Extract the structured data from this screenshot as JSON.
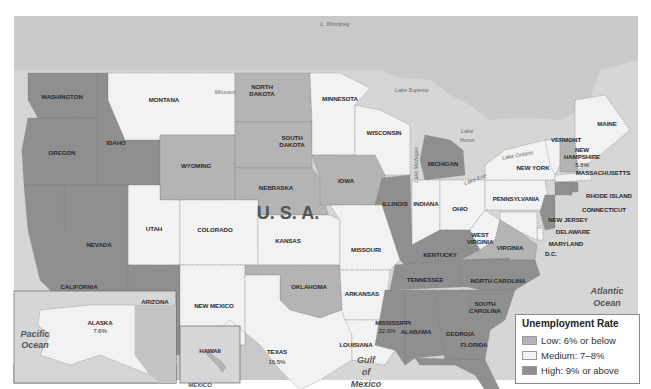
{
  "map": {
    "country_label": "U.   S.   A.",
    "colors": {
      "low": "#b4b4b4",
      "medium": "#f2f2f2",
      "high": "#8f8f8f",
      "water": "#d9d9d9",
      "foreign_land": "#cdcdcd"
    },
    "water_labels": {
      "pacific_1": "Pacific",
      "pacific_2": "Ocean",
      "atlantic_1": "Atlantic",
      "atlantic_2": "Ocean",
      "gulf_1": "Gulf",
      "gulf_2": "of",
      "gulf_3": "Mexico"
    },
    "lake_labels": {
      "winnipeg": "L. Winnipeg",
      "superior": "Lake Superior",
      "michigan": "Lake Michigan",
      "huron_1": "Lake",
      "huron_2": "Huron",
      "erie": "Lake Erie",
      "ontario": "Lake Ontario",
      "missouri_river": "Missouri"
    },
    "other_labels": {
      "mexico": "MEXICO"
    },
    "states": [
      {
        "id": "washington",
        "name": "WASHINGTON",
        "rate": "high"
      },
      {
        "id": "oregon",
        "name": "OREGON",
        "rate": "high"
      },
      {
        "id": "idaho",
        "name": "IDAHO",
        "rate": "high"
      },
      {
        "id": "montana",
        "name": "MONTANA",
        "rate": "medium"
      },
      {
        "id": "wyoming",
        "name": "WYOMING",
        "rate": "low"
      },
      {
        "id": "north-dakota",
        "name": "NORTH DAKOTA",
        "rate": "low"
      },
      {
        "id": "south-dakota",
        "name": "SOUTH DAKOTA",
        "rate": "low"
      },
      {
        "id": "nebraska",
        "name": "NEBRASKA",
        "rate": "low"
      },
      {
        "id": "minnesota",
        "name": "MINNESOTA",
        "rate": "medium"
      },
      {
        "id": "wisconsin",
        "name": "WISCONSIN",
        "rate": "medium"
      },
      {
        "id": "michigan",
        "name": "MICHIGAN",
        "rate": "high"
      },
      {
        "id": "iowa",
        "name": "IOWA",
        "rate": "low"
      },
      {
        "id": "illinois",
        "name": "ILLINOIS",
        "rate": "high"
      },
      {
        "id": "indiana",
        "name": "INDIANA",
        "rate": "medium"
      },
      {
        "id": "ohio",
        "name": "OHIO",
        "rate": "medium"
      },
      {
        "id": "pennsylvania",
        "name": "PENNSYLVANIA",
        "rate": "medium"
      },
      {
        "id": "new-york",
        "name": "NEW YORK",
        "rate": "medium"
      },
      {
        "id": "vermont",
        "name": "VERMONT",
        "rate": "medium"
      },
      {
        "id": "new-hampshire",
        "name": "NEW HAMPSHIRE",
        "rate": "low",
        "value": "5.8%"
      },
      {
        "id": "maine",
        "name": "MAINE",
        "rate": "medium"
      },
      {
        "id": "massachusetts",
        "name": "MASSACHUSETTS",
        "rate": "medium"
      },
      {
        "id": "rhode-island",
        "name": "RHODE ISLAND",
        "rate": "high"
      },
      {
        "id": "connecticut",
        "name": "CONNECTICUT",
        "rate": "high"
      },
      {
        "id": "new-jersey",
        "name": "NEW JERSEY",
        "rate": "high"
      },
      {
        "id": "delaware",
        "name": "DELAWARE",
        "rate": "medium"
      },
      {
        "id": "maryland",
        "name": "MARYLAND",
        "rate": "medium"
      },
      {
        "id": "dc",
        "name": "D.C.",
        "rate": "medium"
      },
      {
        "id": "utah",
        "name": "UTAH",
        "rate": "medium"
      },
      {
        "id": "nevada",
        "name": "NEVADA",
        "rate": "high"
      },
      {
        "id": "california",
        "name": "CALIFORNIA",
        "rate": "high"
      },
      {
        "id": "arizona",
        "name": "ARIZONA",
        "rate": "high"
      },
      {
        "id": "colorado",
        "name": "COLORADO",
        "rate": "medium"
      },
      {
        "id": "new-mexico",
        "name": "NEW MEXICO",
        "rate": "medium"
      },
      {
        "id": "kansas",
        "name": "KANSAS",
        "rate": "medium"
      },
      {
        "id": "oklahoma",
        "name": "OKLAHOMA",
        "rate": "low"
      },
      {
        "id": "texas",
        "name": "TEXAS",
        "rate": "medium",
        "value": "16.5%"
      },
      {
        "id": "missouri",
        "name": "MISSOURI",
        "rate": "medium"
      },
      {
        "id": "arkansas",
        "name": "ARKANSAS",
        "rate": "medium"
      },
      {
        "id": "louisiana",
        "name": "LOUISIANA",
        "rate": "medium"
      },
      {
        "id": "kentucky",
        "name": "KENTUCKY",
        "rate": "high"
      },
      {
        "id": "west-virginia",
        "name": "WEST VIRGINIA",
        "rate": "medium"
      },
      {
        "id": "virginia",
        "name": "VIRGINIA",
        "rate": "low"
      },
      {
        "id": "tennessee",
        "name": "TENNESSEE",
        "rate": "high"
      },
      {
        "id": "north-carolina",
        "name": "NORTH CAROLINA",
        "rate": "high"
      },
      {
        "id": "south-carolina",
        "name": "SOUTH CAROLINA",
        "rate": "high"
      },
      {
        "id": "mississippi",
        "name": "MISSISSIPPI",
        "rate": "high",
        "value": "22.6%"
      },
      {
        "id": "alabama",
        "name": "ALABAMA",
        "rate": "high"
      },
      {
        "id": "georgia",
        "name": "GEORGIA",
        "rate": "high"
      },
      {
        "id": "florida",
        "name": "FLORIDA",
        "rate": "high"
      },
      {
        "id": "alaska",
        "name": "ALASKA",
        "rate": "medium",
        "value": "7.6%"
      },
      {
        "id": "hawaii",
        "name": "HAWAII",
        "rate": "low"
      }
    ]
  },
  "legend": {
    "title": "Unemployment Rate",
    "items": [
      {
        "label": "Low: 6% or below",
        "rate": "low",
        "color": "#b4b4b4"
      },
      {
        "label": "Medium: 7–8%",
        "rate": "medium",
        "color": "#f2f2f2"
      },
      {
        "label": "High: 9% or above",
        "rate": "high",
        "color": "#8f8f8f"
      }
    ]
  }
}
